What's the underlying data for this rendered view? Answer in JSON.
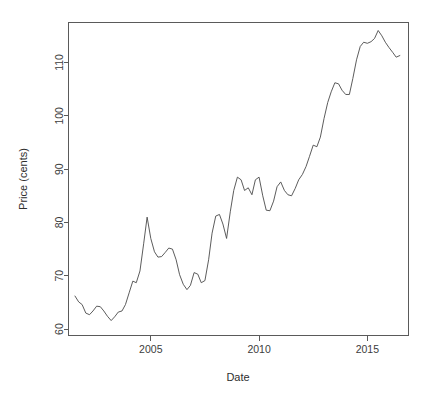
{
  "figure": {
    "background_color": "#ffffff",
    "line_color": "#4a4a4a",
    "axis_color": "#5a5a5a",
    "text_color": "#2e2e2e"
  },
  "axes": {
    "x_title": "Date",
    "y_title": "Price (cents)",
    "x_ticks": [
      "2005",
      "2010",
      "2015"
    ],
    "y_ticks": [
      "60",
      "70",
      "80",
      "90",
      "100",
      "110"
    ]
  },
  "chart_data": {
    "type": "line",
    "title": "",
    "subtitle": "",
    "xlabel": "Date",
    "ylabel": "Price (cents)",
    "xlim": [
      2001.2,
      2016.9
    ],
    "ylim": [
      58.8,
      117.5
    ],
    "xticks": [
      2005,
      2010,
      2015
    ],
    "yticks": [
      60,
      70,
      80,
      90,
      100,
      110
    ],
    "grid": false,
    "legend": "none",
    "box": true,
    "series": [
      {
        "name": "Price",
        "units": "cents",
        "x": [
          2001.5,
          2001.67,
          2001.83,
          2002.0,
          2002.17,
          2002.33,
          2002.5,
          2002.67,
          2002.83,
          2003.0,
          2003.17,
          2003.33,
          2003.5,
          2003.67,
          2003.83,
          2004.0,
          2004.17,
          2004.33,
          2004.5,
          2004.67,
          2004.83,
          2005.0,
          2005.17,
          2005.33,
          2005.5,
          2005.67,
          2005.83,
          2006.0,
          2006.17,
          2006.33,
          2006.5,
          2006.67,
          2006.83,
          2007.0,
          2007.17,
          2007.33,
          2007.5,
          2007.67,
          2007.83,
          2008.0,
          2008.17,
          2008.33,
          2008.5,
          2008.67,
          2008.83,
          2009.0,
          2009.17,
          2009.33,
          2009.5,
          2009.67,
          2009.83,
          2010.0,
          2010.17,
          2010.33,
          2010.5,
          2010.67,
          2010.83,
          2011.0,
          2011.17,
          2011.33,
          2011.5,
          2011.67,
          2011.83,
          2012.0,
          2012.17,
          2012.33,
          2012.5,
          2012.67,
          2012.83,
          2013.0,
          2013.17,
          2013.33,
          2013.5,
          2013.67,
          2013.83,
          2014.0,
          2014.17,
          2014.33,
          2014.5,
          2014.67,
          2014.83,
          2015.0,
          2015.17,
          2015.33,
          2015.5,
          2015.67,
          2015.83,
          2016.0,
          2016.17,
          2016.33,
          2016.5
        ],
        "y": [
          66.2,
          65.1,
          64.6,
          63.0,
          62.7,
          63.4,
          64.3,
          64.2,
          63.4,
          62.4,
          61.6,
          62.3,
          63.2,
          63.4,
          64.6,
          66.8,
          69.0,
          68.7,
          70.9,
          76.0,
          81.0,
          77.0,
          74.5,
          73.5,
          73.6,
          74.4,
          75.2,
          75.0,
          73.0,
          70.2,
          68.4,
          67.4,
          68.2,
          70.6,
          70.3,
          68.7,
          69.1,
          73.0,
          78.0,
          81.2,
          81.5,
          79.7,
          77.0,
          82.0,
          86.0,
          88.5,
          88.0,
          86.0,
          86.5,
          85.2,
          88.0,
          88.5,
          85.0,
          82.3,
          82.2,
          84.0,
          86.7,
          87.6,
          86.0,
          85.2,
          85.0,
          86.4,
          88.0,
          89.0,
          90.5,
          92.4,
          94.5,
          94.2,
          96.0,
          99.5,
          102.5,
          104.5,
          106.2,
          106.0,
          104.8,
          104.0,
          104.0,
          107.0,
          110.5,
          113.0,
          113.8,
          113.6,
          113.9,
          114.5,
          116.0,
          115.0,
          113.8,
          112.8,
          111.9,
          111.0,
          111.3
        ]
      }
    ]
  }
}
